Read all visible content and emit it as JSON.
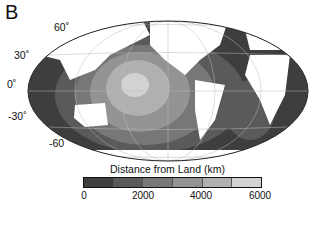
{
  "panel_label": "B",
  "map": {
    "projection": "Mollweide (world, Pacific-centered)",
    "latitude_labels": [
      "60˚",
      "30˚",
      "0˚",
      "-30˚",
      "-60"
    ],
    "land_color": "#ffffff",
    "ocean_shades": [
      "#3e3e3e",
      "#5a5a5a",
      "#777777",
      "#939393",
      "#b0b0b0",
      "#d2d2d2"
    ]
  },
  "colorbar": {
    "title": "Distance from Land (km)",
    "ticks": [
      "0",
      "2000",
      "4000",
      "6000"
    ],
    "min": 0,
    "max": 6000,
    "bins": 6
  }
}
